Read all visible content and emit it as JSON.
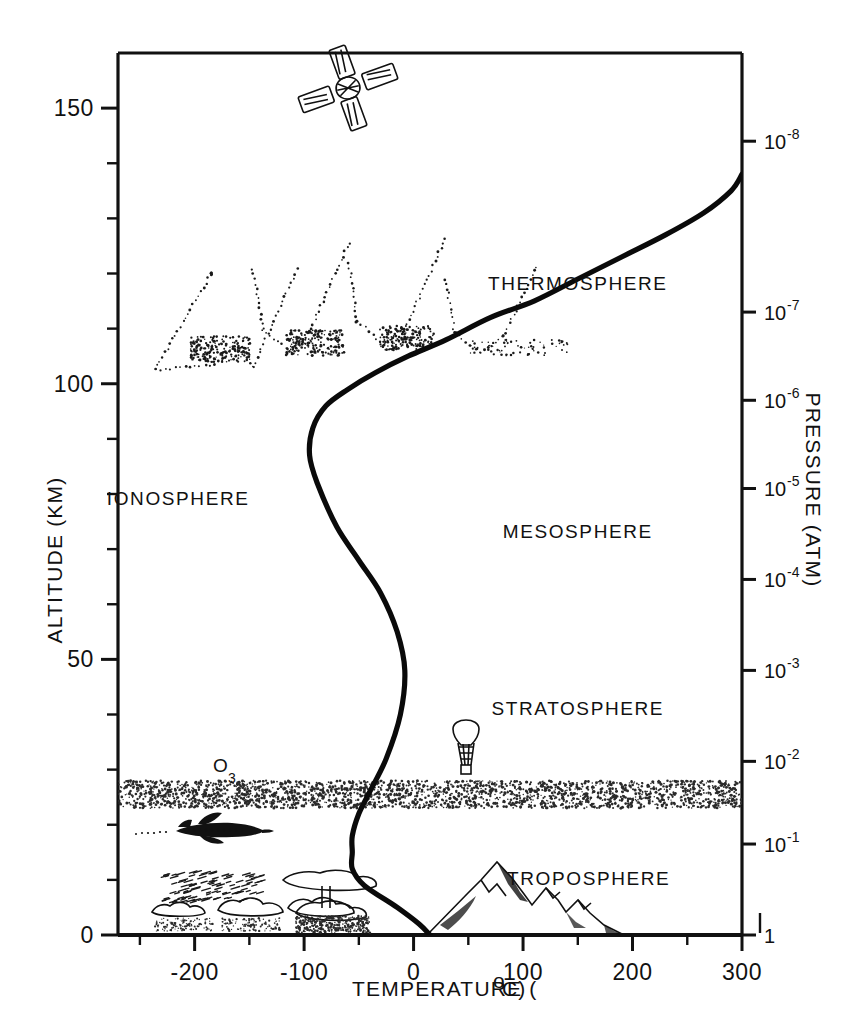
{
  "figure": {
    "background_color": "#ffffff",
    "ink_color": "#111111"
  },
  "axes": {
    "x": {
      "title": "TEMPERATURE (°C)",
      "title_main": "TEMPERATURE (",
      "title_degree": "o",
      "title_unit": "C)",
      "ticks": [
        "-200",
        "-100",
        "0",
        "100",
        "200",
        "300"
      ],
      "tick_values": [
        -200,
        -100,
        0,
        100,
        200,
        300
      ],
      "min": -270,
      "max": 300,
      "minor_tick_interval": 50
    },
    "y_left": {
      "title": "ALTITUDE (KM)",
      "ticks": [
        "0",
        "50",
        "100",
        "150"
      ],
      "tick_values": [
        0,
        50,
        100,
        150
      ],
      "min": 0,
      "max": 160,
      "minor_tick_interval": 10
    },
    "y_right": {
      "title": "PRESSURE (ATM)",
      "ticks": [
        {
          "mantissa": "1",
          "exponent": ""
        },
        {
          "mantissa": "10",
          "exponent": "-1"
        },
        {
          "mantissa": "10",
          "exponent": "-2"
        },
        {
          "mantissa": "10",
          "exponent": "-3"
        },
        {
          "mantissa": "10",
          "exponent": "-4"
        },
        {
          "mantissa": "10",
          "exponent": "-5"
        },
        {
          "mantissa": "10",
          "exponent": "-6"
        },
        {
          "mantissa": "10",
          "exponent": "-7"
        },
        {
          "mantissa": "10",
          "exponent": "-8"
        }
      ],
      "tick_altitudes_km": [
        0,
        16.5,
        31.5,
        48,
        64.5,
        81,
        97,
        113,
        144
      ]
    }
  },
  "layers": [
    {
      "name": "TROPOSPHERE",
      "altitude_km": 9,
      "temperature_c": 160
    },
    {
      "name": "STRATOSPHERE",
      "altitude_km": 40,
      "temperature_c": 150
    },
    {
      "name": "MESOSPHERE",
      "altitude_km": 72,
      "temperature_c": 150
    },
    {
      "name": "THERMOSPHERE",
      "altitude_km": 117,
      "temperature_c": 150
    },
    {
      "name": "IONOSPHERE",
      "altitude_km": 78,
      "temperature_c": -215
    }
  ],
  "annotations": {
    "ozone": {
      "label_main": "O",
      "label_sub": "3",
      "altitude_km": 26,
      "band_bottom_km": 23,
      "band_top_km": 28
    },
    "satellite": {
      "name": "satellite",
      "altitude_km": 152,
      "temperature_c": -108
    },
    "aurora": {
      "name": "aurora",
      "altitude_range_km": [
        98,
        122
      ]
    },
    "balloon": {
      "name": "weather-balloon",
      "altitude_km": 34,
      "temperature_c": 40
    },
    "aircraft": {
      "name": "aircraft",
      "altitude_km": 19,
      "temperature_c": -190
    },
    "mountains": {
      "name": "mountain-range",
      "peak_altitude_km": 8
    },
    "clouds": {
      "name": "clouds",
      "altitude_km": 4
    },
    "thunderstorm": {
      "name": "cumulonimbus-anvil",
      "altitude_km": 7
    }
  },
  "chart_data": {
    "type": "line",
    "xlabel": "TEMPERATURE (°C)",
    "ylabel": "ALTITUDE (KM)",
    "y2label": "PRESSURE (ATM)",
    "xlim": [
      -270,
      300
    ],
    "ylim": [
      0,
      160
    ],
    "grid": false,
    "legend": "none",
    "series": [
      {
        "name": "Standard atmosphere temperature",
        "x": [
          15,
          5,
          -15,
          -45,
          -56,
          -56,
          -56,
          -50,
          -40,
          -25,
          -12,
          -8,
          -15,
          -30,
          -50,
          -70,
          -88,
          -95,
          -92,
          -80,
          -60,
          -35,
          -5,
          30,
          70,
          110,
          150,
          190,
          230,
          265,
          290,
          300
        ],
        "y": [
          0,
          2,
          5,
          9,
          12,
          15,
          18,
          22,
          26,
          32,
          40,
          48,
          55,
          62,
          68,
          74,
          82,
          87,
          92,
          96,
          99,
          102,
          105,
          108,
          112,
          115,
          119,
          123,
          127,
          131,
          135,
          138
        ]
      }
    ],
    "features": [
      {
        "name": "surface",
        "altitude_km": 0,
        "temperature_c": 15
      },
      {
        "name": "tropopause",
        "altitude_km": 13,
        "temperature_c": -56
      },
      {
        "name": "stratopause",
        "altitude_km": 50,
        "temperature_c": -8
      },
      {
        "name": "mesopause",
        "altitude_km": 87,
        "temperature_c": -95
      },
      {
        "name": "thermosphere-top",
        "altitude_km": 138,
        "temperature_c": 300
      }
    ]
  }
}
